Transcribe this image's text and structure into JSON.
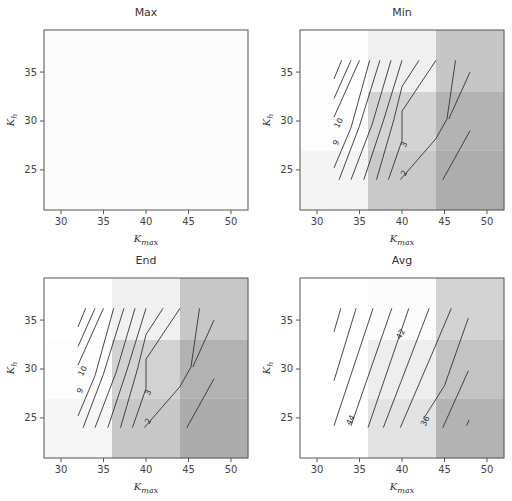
{
  "chart_data": [
    {
      "type": "heatmap",
      "title": "Max",
      "xlabel": "K_max",
      "ylabel": "K_h",
      "xlim": [
        28,
        52
      ],
      "ylim": [
        20.9,
        39.3
      ],
      "xticks": [
        30,
        35,
        40,
        45,
        50
      ],
      "yticks": [
        25,
        30,
        35
      ],
      "grid": false,
      "cell_x_edges": [
        28,
        36,
        44,
        52
      ],
      "cell_y_edges": [
        20.9,
        27,
        33,
        39.3
      ],
      "cell_shades": [
        [
          "#fbfbfb",
          "#fbfbfb",
          "#fbfbfb"
        ],
        [
          "#fbfbfb",
          "#fbfbfb",
          "#fbfbfb"
        ],
        [
          "#fbfbfb",
          "#fbfbfb",
          "#fbfbfb"
        ]
      ],
      "contours": []
    },
    {
      "type": "heatmap",
      "title": "Min",
      "xlabel": "K_max",
      "ylabel": "K_h",
      "xlim": [
        28,
        52
      ],
      "ylim": [
        20.9,
        39.3
      ],
      "xticks": [
        30,
        35,
        40,
        45,
        50
      ],
      "yticks": [
        25,
        30,
        35
      ],
      "grid": false,
      "cell_x_edges": [
        28,
        36,
        44,
        52
      ],
      "cell_y_edges": [
        20.9,
        27,
        33,
        39.3
      ],
      "cell_shades": [
        [
          "#f4f4f4",
          "#c9c9c9",
          "#adadad"
        ],
        [
          "#fdfdfd",
          "#d3d3d3",
          "#b3b3b3"
        ],
        [
          "#fefefe",
          "#f0f0f0",
          "#c6c6c6"
        ]
      ],
      "contours": [
        {
          "points": [
            [
              32,
              34.3
            ],
            [
              32.9,
              36.2
            ]
          ]
        },
        {
          "points": [
            [
              32,
              32.3
            ],
            [
              34,
              36.2
            ]
          ]
        },
        {
          "points": [
            [
              32,
              30.4
            ],
            [
              35,
              36.2
            ]
          ]
        },
        {
          "points": [
            [
              32,
              25.2
            ],
            [
              34,
              29.3
            ],
            [
              36.2,
              36.2
            ]
          ],
          "label": "9",
          "label_at": [
            32.2,
            27.8
          ]
        },
        {
          "points": [
            [
              32.6,
              24
            ],
            [
              35,
              29.5
            ],
            [
              37.4,
              36.2
            ]
          ],
          "label": "10",
          "label_at": [
            32.5,
            29.8
          ]
        },
        {
          "points": [
            [
              34,
              24
            ],
            [
              36.5,
              29.7
            ],
            [
              38.7,
              36.2
            ]
          ]
        },
        {
          "points": [
            [
              35.5,
              24
            ],
            [
              37.8,
              30
            ],
            [
              40,
              36.2
            ]
          ]
        },
        {
          "points": [
            [
              37,
              24
            ],
            [
              39,
              30
            ],
            [
              40,
              33.5
            ],
            [
              42,
              36.2
            ]
          ]
        },
        {
          "points": [
            [
              38.4,
              24
            ],
            [
              40,
              28
            ],
            [
              40,
              31
            ],
            [
              44,
              36.2
            ]
          ],
          "label": "3",
          "label_at": [
            40.2,
            27.6
          ]
        },
        {
          "points": [
            [
              39.8,
              24
            ],
            [
              44,
              28.2
            ],
            [
              45.3,
              30.2
            ],
            [
              46.3,
              36.2
            ]
          ],
          "label": "2",
          "label_at": [
            40.2,
            24.7
          ]
        },
        {
          "points": [
            [
              44.8,
              24
            ],
            [
              48,
              29
            ]
          ]
        },
        {
          "points": [
            [
              45.5,
              30.2
            ],
            [
              48,
              35
            ]
          ]
        }
      ]
    },
    {
      "type": "heatmap",
      "title": "End",
      "xlabel": "K_max",
      "ylabel": "K_h",
      "xlim": [
        28,
        52
      ],
      "ylim": [
        20.9,
        39.3
      ],
      "xticks": [
        30,
        35,
        40,
        45,
        50
      ],
      "yticks": [
        25,
        30,
        35
      ],
      "grid": false,
      "cell_x_edges": [
        28,
        36,
        44,
        52
      ],
      "cell_y_edges": [
        20.9,
        27,
        33,
        39.3
      ],
      "cell_shades": [
        [
          "#f6f6f6",
          "#c8c8c8",
          "#acacac"
        ],
        [
          "#fdfdfd",
          "#d2d2d2",
          "#b2b2b2"
        ],
        [
          "#ffffff",
          "#f1f1f1",
          "#c7c7c7"
        ]
      ],
      "contours": [
        {
          "points": [
            [
              32,
              34.3
            ],
            [
              32.9,
              36.2
            ]
          ]
        },
        {
          "points": [
            [
              32,
              32.3
            ],
            [
              34,
              36.2
            ]
          ]
        },
        {
          "points": [
            [
              32,
              30.4
            ],
            [
              35,
              36.2
            ]
          ]
        },
        {
          "points": [
            [
              32,
              25.2
            ],
            [
              34,
              29.3
            ],
            [
              36.2,
              36.2
            ]
          ],
          "label": "9",
          "label_at": [
            32.2,
            27.8
          ]
        },
        {
          "points": [
            [
              32.6,
              24
            ],
            [
              35,
              29.5
            ],
            [
              37.4,
              36.2
            ]
          ],
          "label": "10",
          "label_at": [
            32.5,
            29.8
          ]
        },
        {
          "points": [
            [
              34,
              24
            ],
            [
              36.5,
              29.7
            ],
            [
              38.7,
              36.2
            ]
          ]
        },
        {
          "points": [
            [
              35.5,
              24
            ],
            [
              37.8,
              30
            ],
            [
              40,
              36.2
            ]
          ]
        },
        {
          "points": [
            [
              37,
              24
            ],
            [
              39,
              30
            ],
            [
              40,
              33.5
            ],
            [
              42,
              36.2
            ]
          ]
        },
        {
          "points": [
            [
              38.4,
              24
            ],
            [
              40,
              28
            ],
            [
              40,
              31
            ],
            [
              44,
              36.2
            ]
          ],
          "label": "3",
          "label_at": [
            40.2,
            27.6
          ]
        },
        {
          "points": [
            [
              39.8,
              24
            ],
            [
              44,
              28.2
            ],
            [
              45.3,
              30.2
            ],
            [
              46.3,
              36.2
            ]
          ],
          "label": "2",
          "label_at": [
            40.2,
            24.7
          ]
        },
        {
          "points": [
            [
              44.8,
              24
            ],
            [
              48,
              29
            ]
          ]
        },
        {
          "points": [
            [
              45.5,
              30.2
            ],
            [
              48,
              35
            ]
          ]
        }
      ]
    },
    {
      "type": "heatmap",
      "title": "Avg",
      "xlabel": "K_max",
      "ylabel": "K_h",
      "xlim": [
        28,
        52
      ],
      "ylim": [
        20.9,
        39.3
      ],
      "xticks": [
        30,
        35,
        40,
        45,
        50
      ],
      "yticks": [
        25,
        30,
        35
      ],
      "grid": false,
      "cell_x_edges": [
        28,
        36,
        44,
        52
      ],
      "cell_y_edges": [
        20.9,
        27,
        33,
        39.3
      ],
      "cell_shades": [
        [
          "#ffffff",
          "#e3e3e3",
          "#b3b3b3"
        ],
        [
          "#ffffff",
          "#eeeeee",
          "#c3c3c3"
        ],
        [
          "#ffffff",
          "#fcfcfc",
          "#d3d3d3"
        ]
      ],
      "contours": [
        {
          "points": [
            [
              32,
              33.8
            ],
            [
              32.8,
              36.2
            ]
          ]
        },
        {
          "points": [
            [
              32,
              28.8
            ],
            [
              34.6,
              36.2
            ]
          ]
        },
        {
          "points": [
            [
              32,
              24.2
            ],
            [
              36.6,
              36.2
            ]
          ]
        },
        {
          "points": [
            [
              34,
              24.2
            ],
            [
              38.8,
              36.2
            ]
          ],
          "label": "44",
          "label_at": [
            33.9,
            24.8
          ]
        },
        {
          "points": [
            [
              36,
              24
            ],
            [
              40.8,
              36.2
            ]
          ],
          "label": "42",
          "label_at": [
            39.8,
            33.6
          ]
        },
        {
          "points": [
            [
              37.8,
              24
            ],
            [
              43.2,
              36.2
            ]
          ]
        },
        {
          "points": [
            [
              39.8,
              24
            ],
            [
              43.5,
              31.5
            ],
            [
              45.8,
              36.2
            ]
          ]
        },
        {
          "points": [
            [
              42.6,
              25
            ],
            [
              45,
              28.3
            ],
            [
              47.8,
              35.2
            ]
          ],
          "label": "36",
          "label_at": [
            42.7,
            24.7
          ]
        },
        {
          "points": [
            [
              44.8,
              24
            ],
            [
              47.8,
              29.8
            ]
          ]
        },
        {
          "points": [
            [
              47.6,
              24.2
            ],
            [
              47.9,
              24.8
            ]
          ]
        }
      ]
    }
  ],
  "panels": [
    {
      "title": "Max",
      "xlabel_main": "K",
      "xlabel_sub": "max",
      "ylabel_main": "K",
      "ylabel_sub": "h"
    },
    {
      "title": "Min",
      "xlabel_main": "K",
      "xlabel_sub": "max",
      "ylabel_main": "K",
      "ylabel_sub": "h"
    },
    {
      "title": "End",
      "xlabel_main": "K",
      "xlabel_sub": "max",
      "ylabel_main": "K",
      "ylabel_sub": "h"
    },
    {
      "title": "Avg",
      "xlabel_main": "K",
      "xlabel_sub": "max",
      "ylabel_main": "K",
      "ylabel_sub": "h"
    }
  ],
  "colors": {
    "axis_frame": "#555555",
    "contour_line": "#333333",
    "background": "#ffffff"
  }
}
